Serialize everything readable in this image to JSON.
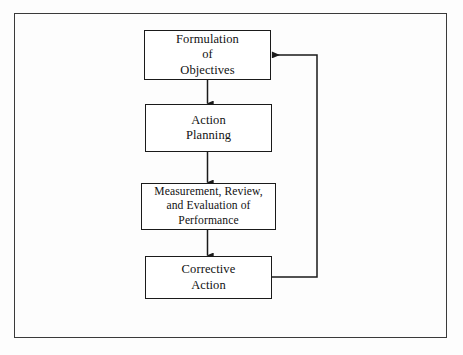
{
  "diagram": {
    "type": "flowchart",
    "background_color": "#fdfdfd",
    "line_color": "#1a1a1a",
    "frame_color": "#3a3a3a",
    "nodes": [
      {
        "id": "formulation",
        "label": "Formulation\nof\nObjectives",
        "order": 1
      },
      {
        "id": "action_planning",
        "label": "Action\nPlanning",
        "order": 2
      },
      {
        "id": "measurement",
        "label": "Measurement, Review,\nand Evaluation of\nPerformance",
        "order": 3
      },
      {
        "id": "corrective",
        "label": "Corrective\nAction",
        "order": 4
      }
    ],
    "connectors": [
      {
        "id": "c1",
        "from": "formulation",
        "to": "action_planning",
        "style": "arrow-down"
      },
      {
        "id": "c2",
        "from": "action_planning",
        "to": "measurement",
        "style": "arrow-down"
      },
      {
        "id": "c3",
        "from": "measurement",
        "to": "corrective",
        "style": "arrow-down"
      },
      {
        "id": "c4",
        "from": "corrective",
        "to": "formulation",
        "style": "feedback-loop-right"
      }
    ]
  }
}
